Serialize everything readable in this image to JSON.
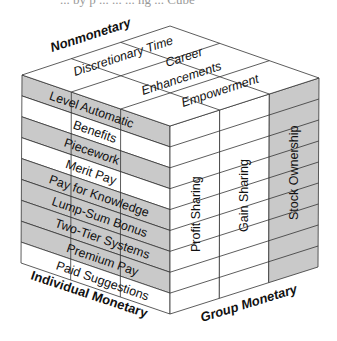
{
  "caption_fragment": "... by p ... ... ... ng ... Cube",
  "colors": {
    "shaded": "#c9c9c9",
    "white": "#ffffff",
    "line": "#333333",
    "text": "#111111"
  },
  "axes": {
    "top": "Nonmonetary",
    "left": "Individual Monetary",
    "right": "Group Monetary"
  },
  "top_face": {
    "items": [
      "Discretionary Time",
      "Career",
      "Enhancements",
      "Empowerment"
    ]
  },
  "left_face": {
    "rows": [
      {
        "label": "Level Automatic",
        "shaded": true
      },
      {
        "label": "Benefits",
        "shaded": false
      },
      {
        "label": "Piecework",
        "shaded": true
      },
      {
        "label": "Merit Pay",
        "shaded": false
      },
      {
        "label": "Pay for Knowledge",
        "shaded": true
      },
      {
        "label": "Lump-Sum Bonus",
        "shaded": true
      },
      {
        "label": "Two-Tier Systems",
        "shaded": true
      },
      {
        "label": "Premium Pay",
        "shaded": true
      },
      {
        "label": "Paid Suggestions",
        "shaded": false
      }
    ]
  },
  "right_face": {
    "columns": [
      {
        "label": "Profit Sharing",
        "shaded": false
      },
      {
        "label": "Gain Sharing",
        "shaded": false
      },
      {
        "label": "Stock Ownership",
        "shaded": true
      }
    ]
  }
}
